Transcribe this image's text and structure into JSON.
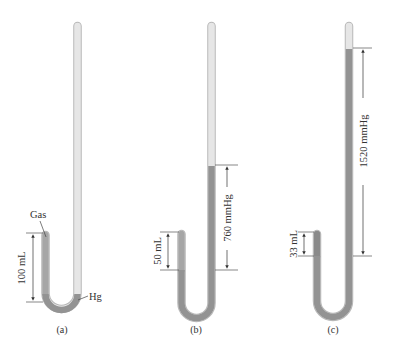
{
  "figure": {
    "colors": {
      "glass": "#e4e4e4",
      "glass_edge": "#b8b8b8",
      "mercury": "#8f8f8f",
      "gas": "#a6a6a6",
      "line": "#444444"
    },
    "panels": [
      {
        "id": "a",
        "caption": "(a)",
        "gas_label": "Gas",
        "mercury_label": "Hg",
        "volume_label": "100 mL",
        "pressure_label": ""
      },
      {
        "id": "b",
        "caption": "(b)",
        "volume_label": "50 mL",
        "pressure_label": "760 mmHg"
      },
      {
        "id": "c",
        "caption": "(c)",
        "volume_label": "33 mL",
        "pressure_label": "1520 mmHg"
      }
    ]
  }
}
